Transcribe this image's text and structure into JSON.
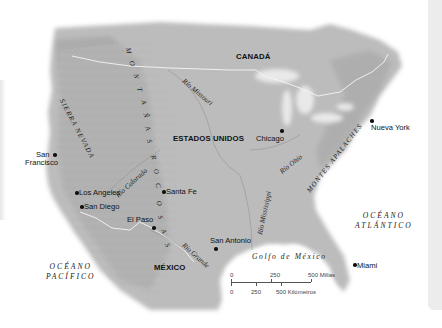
{
  "map": {
    "countries": {
      "canada": "CANADÁ",
      "usa": "ESTADOS UNIDOS",
      "mexico": "MÉXICO"
    },
    "cities": [
      {
        "name": "San Francisco",
        "line1": "San",
        "line2": "Francisco"
      },
      {
        "name": "Los Angeles"
      },
      {
        "name": "San Diego"
      },
      {
        "name": "Santa Fe"
      },
      {
        "name": "El Paso"
      },
      {
        "name": "San Antonio"
      },
      {
        "name": "Chicago"
      },
      {
        "name": "Nueva York"
      },
      {
        "name": "Miami"
      }
    ],
    "oceans": {
      "pacific_line1": "OCÉANO",
      "pacific_line2": "PACÍFICO",
      "atlantic_line1": "OCÉANO",
      "atlantic_line2": "ATLÁNTICO"
    },
    "gulf": "Golfo de México",
    "rivers": {
      "missouri": "Río Missouri",
      "colorado": "Río Colorado",
      "ohio": "Río Ohio",
      "mississippi": "Río Mississippi",
      "grande": "Río Grande"
    },
    "mountains": {
      "sierra_nevada": "SIERRA NEVADA",
      "rocky": "MONTAÑAS ROCOSAS",
      "rocky_letters": [
        "M",
        "O",
        "N",
        "T",
        "A",
        "Ñ",
        "A",
        "S",
        "R",
        "O",
        "C",
        "O",
        "S",
        "A",
        "S"
      ],
      "appalachian": "MONTES APALACHES"
    },
    "scale": {
      "miles": [
        "0",
        "250",
        "500 Millas"
      ],
      "km": [
        "0",
        "250",
        "500 Kilómetros"
      ]
    },
    "colors": {
      "land": "#b9b9b9",
      "land_dark": "#a3a3a3",
      "water": "#ffffff",
      "border": "#f4f4f4",
      "text": "#111111"
    }
  }
}
